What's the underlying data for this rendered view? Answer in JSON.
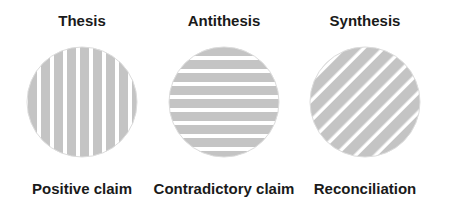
{
  "colors": {
    "stripe": "#c4c4c4",
    "gap": "#ffffff",
    "text": "#1a1a1a"
  },
  "panels": [
    {
      "title": "Thesis",
      "caption": "Positive claim",
      "pattern": "vertical-stripes"
    },
    {
      "title": "Antithesis",
      "caption": "Contradictory claim",
      "pattern": "horizontal-stripes"
    },
    {
      "title": "Synthesis",
      "caption": "Reconciliation",
      "pattern": "diagonal-stripes"
    }
  ]
}
